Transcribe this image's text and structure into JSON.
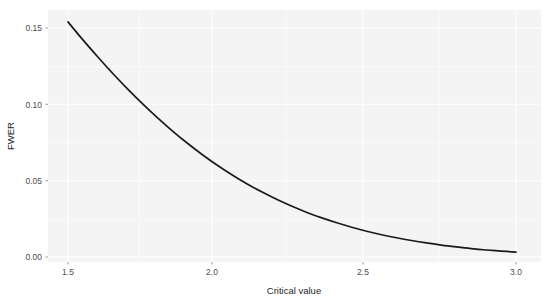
{
  "chart_data": {
    "type": "line",
    "title": "",
    "subtitle": "",
    "xlabel": "Critical value",
    "ylabel": "FWER",
    "xlim": [
      1.47,
      3.03
    ],
    "ylim": [
      -0.003,
      0.159
    ],
    "xticks": [
      "1.5",
      "2.0",
      "2.5",
      "3.0"
    ],
    "xtick_values": [
      1.5,
      2.0,
      2.5,
      3.0
    ],
    "yticks": [
      "0.00",
      "0.05",
      "0.10",
      "0.15"
    ],
    "ytick_values": [
      0.0,
      0.05,
      0.1,
      0.15
    ],
    "grid": true,
    "grid_minor": true,
    "legend": false,
    "legend_position": "none",
    "panel_background": "#f4f4f4",
    "line_color": "#1a1a1a",
    "series": [
      {
        "name": "FWER",
        "x": [
          1.5,
          1.55,
          1.6,
          1.65,
          1.7,
          1.75,
          1.8,
          1.85,
          1.9,
          1.95,
          2.0,
          2.05,
          2.1,
          2.15,
          2.2,
          2.25,
          2.3,
          2.35,
          2.4,
          2.45,
          2.5,
          2.55,
          2.6,
          2.65,
          2.7,
          2.75,
          2.8,
          2.85,
          2.9,
          2.95,
          3.0
        ],
        "values": [
          0.154,
          0.1422,
          0.131,
          0.1202,
          0.11,
          0.1003,
          0.0911,
          0.0825,
          0.0745,
          0.067,
          0.0601,
          0.0537,
          0.0478,
          0.0425,
          0.0376,
          0.0332,
          0.0292,
          0.0256,
          0.0224,
          0.0195,
          0.0169,
          0.0146,
          0.0126,
          0.0108,
          0.0092,
          0.0078,
          0.0066,
          0.0055,
          0.0046,
          0.0039,
          0.0032
        ]
      }
    ]
  },
  "axes": {
    "x_title": "Critical value",
    "y_title": "FWER",
    "x_tick_labels": [
      "1.5",
      "2.0",
      "2.5",
      "3.0"
    ],
    "y_tick_labels": [
      "0.00",
      "0.05",
      "0.10",
      "0.15"
    ]
  }
}
